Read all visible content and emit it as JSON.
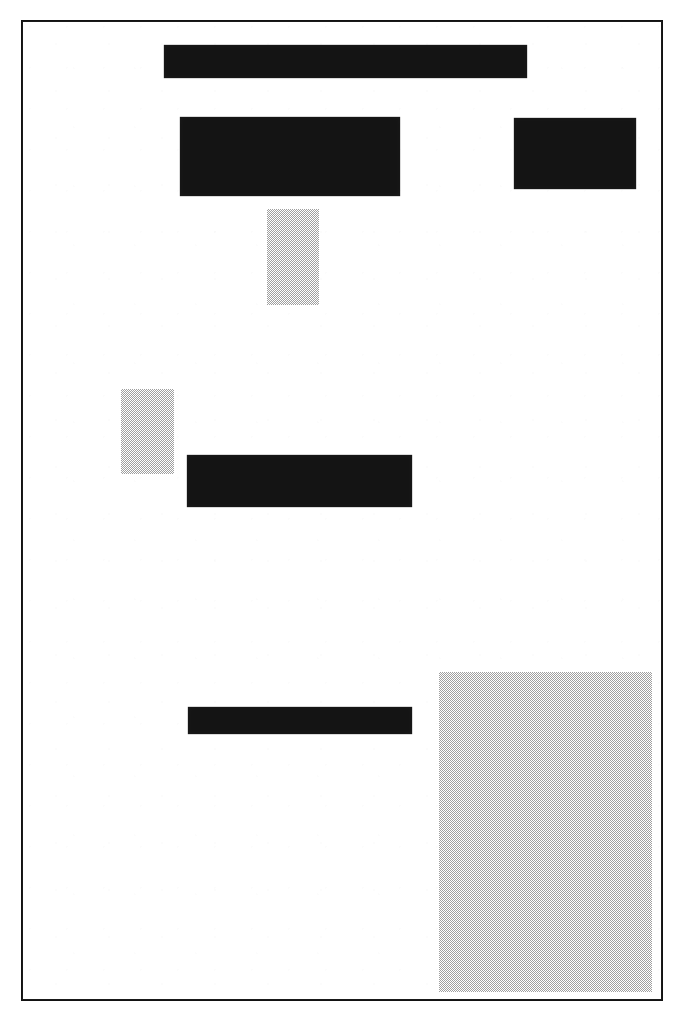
{
  "document": {
    "kind": "scanned-redacted-page",
    "page_background": "#ffffff",
    "border_color": "#1a1a1a",
    "page_frame": {
      "x": 21,
      "y": 20,
      "width": 642,
      "height": 981
    },
    "canvas": {
      "width": 675,
      "height": 1020
    }
  },
  "colors": {
    "redaction_solid": "#141414",
    "redaction_dither": "#9a9a9a",
    "paper": "#ffffff",
    "rule": "#1a1a1a"
  },
  "redactions": [
    {
      "id": "redaction-title-bar",
      "style": "solid",
      "label": "",
      "x": 162,
      "y": 43,
      "width": 363,
      "height": 33
    },
    {
      "id": "redaction-block-left",
      "style": "solid",
      "label": "",
      "x": 178,
      "y": 115,
      "width": 220,
      "height": 79
    },
    {
      "id": "redaction-block-right",
      "style": "solid",
      "label": "",
      "x": 512,
      "y": 116,
      "width": 122,
      "height": 71
    },
    {
      "id": "redaction-column-upper",
      "style": "dither",
      "label": "",
      "x": 265,
      "y": 207,
      "width": 52,
      "height": 96
    },
    {
      "id": "redaction-column-left-margin",
      "style": "dither",
      "label": "",
      "x": 119,
      "y": 387,
      "width": 53,
      "height": 85
    },
    {
      "id": "redaction-bar-middle",
      "style": "solid",
      "label": "",
      "x": 185,
      "y": 453,
      "width": 225,
      "height": 52
    },
    {
      "id": "redaction-bar-lower",
      "style": "solid",
      "label": "",
      "x": 186,
      "y": 705,
      "width": 224,
      "height": 27
    },
    {
      "id": "redaction-panel-bottom-right",
      "style": "dither",
      "label": "",
      "x": 437,
      "y": 670,
      "width": 213,
      "height": 320
    }
  ]
}
